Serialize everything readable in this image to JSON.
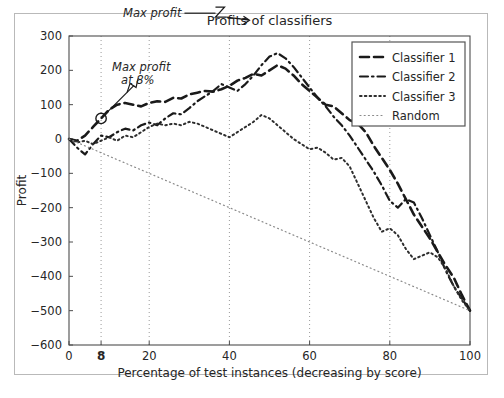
{
  "chart_data": {
    "type": "line",
    "title": "Profits of classifiers",
    "xlabel": "Percentage of test instances (decreasing by score)",
    "ylabel": "Profit",
    "xlim": [
      0,
      100
    ],
    "ylim": [
      -600,
      300
    ],
    "xticks": [
      0,
      8,
      20,
      40,
      60,
      80,
      100
    ],
    "xticklabels": [
      "0",
      "8",
      "20",
      "40",
      "60",
      "80",
      "100"
    ],
    "xtick_bold": [
      "8"
    ],
    "yticks": [
      -600,
      -500,
      -400,
      -300,
      -200,
      -100,
      0,
      100,
      200,
      300
    ],
    "yticklabels": [
      "−600",
      "−500",
      "−400",
      "−300",
      "−200",
      "−100",
      "0",
      "100",
      "200",
      "300"
    ],
    "grid": true,
    "grid_style": "dotted-vertical",
    "grid_x": [
      8,
      20,
      40,
      60,
      80
    ],
    "legend_position": "upper right",
    "legend_entries": [
      "Classifier 1",
      "Classifier 2",
      "Classifier 3",
      "Random"
    ],
    "annotations": [
      {
        "text_line1": "Max profit",
        "text_line2": "at 8%",
        "point_x": 8,
        "point_y": 60,
        "marker": "circle",
        "style": "italic"
      },
      {
        "text_line1": "Max profit",
        "point_x": 47,
        "point_y": 250,
        "marker": "arrow",
        "style": "italic"
      }
    ],
    "series": [
      {
        "name": "Classifier 1",
        "line_style": "dashed",
        "color": "#1a1a1a",
        "x": [
          0,
          2,
          4,
          6,
          8,
          10,
          12,
          14,
          16,
          18,
          20,
          22,
          24,
          26,
          28,
          30,
          32,
          34,
          36,
          38,
          40,
          42,
          44,
          46,
          48,
          50,
          52,
          54,
          56,
          58,
          60,
          62,
          64,
          66,
          68,
          70,
          72,
          74,
          76,
          78,
          80,
          82,
          84,
          86,
          88,
          90,
          92,
          94,
          96,
          98,
          100
        ],
        "y": [
          0,
          -5,
          10,
          35,
          60,
          85,
          100,
          105,
          100,
          95,
          105,
          110,
          108,
          120,
          118,
          130,
          135,
          140,
          138,
          145,
          155,
          170,
          178,
          190,
          185,
          200,
          215,
          205,
          185,
          160,
          140,
          120,
          100,
          95,
          75,
          55,
          45,
          20,
          -20,
          -55,
          -90,
          -130,
          -175,
          -220,
          -255,
          -290,
          -330,
          -370,
          -405,
          -455,
          -500
        ]
      },
      {
        "name": "Classifier 2",
        "line_style": "dashdot",
        "color": "#1a1a1a",
        "x": [
          0,
          2,
          4,
          6,
          8,
          10,
          12,
          14,
          16,
          18,
          20,
          22,
          24,
          26,
          28,
          30,
          32,
          34,
          36,
          38,
          40,
          42,
          44,
          46,
          48,
          50,
          52,
          54,
          56,
          58,
          60,
          62,
          64,
          66,
          68,
          70,
          72,
          74,
          76,
          78,
          80,
          82,
          84,
          86,
          88,
          90,
          92,
          94,
          96,
          98,
          100
        ],
        "y": [
          0,
          -25,
          -45,
          -15,
          10,
          5,
          20,
          30,
          25,
          40,
          48,
          40,
          60,
          75,
          72,
          90,
          110,
          125,
          140,
          160,
          150,
          140,
          160,
          185,
          215,
          240,
          250,
          235,
          210,
          180,
          150,
          120,
          95,
          65,
          40,
          10,
          -25,
          -60,
          -95,
          -135,
          -180,
          -200,
          -175,
          -185,
          -230,
          -280,
          -330,
          -385,
          -430,
          -465,
          -500
        ]
      },
      {
        "name": "Classifier 3",
        "line_style": "dotted",
        "color": "#2e2e2e",
        "x": [
          0,
          2,
          4,
          6,
          8,
          10,
          12,
          14,
          16,
          18,
          20,
          22,
          24,
          26,
          28,
          30,
          32,
          34,
          36,
          38,
          40,
          42,
          44,
          46,
          48,
          50,
          52,
          54,
          56,
          58,
          60,
          62,
          64,
          66,
          68,
          70,
          72,
          74,
          76,
          78,
          80,
          82,
          84,
          86,
          88,
          90,
          92,
          94,
          96,
          98,
          100
        ],
        "y": [
          0,
          -10,
          -5,
          -15,
          -5,
          5,
          -5,
          10,
          5,
          20,
          35,
          45,
          40,
          45,
          40,
          50,
          45,
          35,
          25,
          15,
          5,
          20,
          35,
          50,
          70,
          60,
          40,
          20,
          0,
          -15,
          -30,
          -25,
          -40,
          -60,
          -55,
          -80,
          -130,
          -180,
          -230,
          -270,
          -260,
          -280,
          -320,
          -350,
          -340,
          -330,
          -345,
          -380,
          -430,
          -470,
          -500
        ]
      },
      {
        "name": "Random",
        "line_style": "fine-dotted",
        "color": "#8a8a8a",
        "x": [
          0,
          100
        ],
        "y": [
          0,
          -500
        ]
      }
    ]
  }
}
